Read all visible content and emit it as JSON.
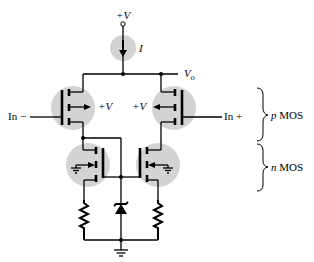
{
  "diagram": {
    "type": "circuit-schematic",
    "supply_label": "+V",
    "current_source_label": "I",
    "output_label": "V",
    "output_subscript": "o",
    "inputs": {
      "inverting": "In −",
      "noninverting": "In +"
    },
    "pmos_body_labels": [
      "+V",
      "+V"
    ],
    "groups": [
      {
        "italic": "p",
        "text": " MOS"
      },
      {
        "italic": "n",
        "text": " MOS"
      }
    ],
    "components": [
      "current-source",
      "pmos-transistor",
      "pmos-transistor",
      "nmos-transistor",
      "nmos-transistor",
      "zener-diode",
      "resistor",
      "resistor",
      "ground"
    ],
    "colors": {
      "line": "#000000",
      "halo": "#d3d3d3"
    }
  }
}
